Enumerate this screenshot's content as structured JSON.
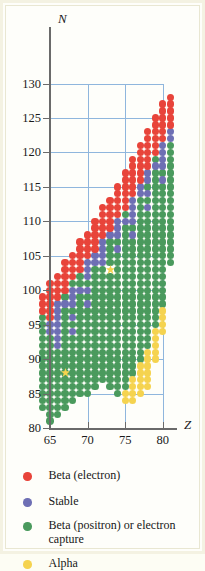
{
  "figure": {
    "kind": "nuclide-stability-chart",
    "axes": {
      "x": {
        "name": "Z",
        "ticks": [
          65,
          70,
          75,
          80
        ],
        "min": 63,
        "max": 82,
        "gridlines": [
          70,
          75,
          80
        ]
      },
      "y": {
        "name": "N",
        "ticks": [
          80,
          85,
          90,
          95,
          100,
          105,
          110,
          115,
          120,
          125,
          130
        ],
        "min": 80,
        "max": 131,
        "gridlines": [
          85,
          90,
          95,
          100,
          105,
          110,
          115,
          120,
          125,
          130
        ]
      },
      "grid": true
    }
  },
  "colors": {
    "beta_electron": "#e8443a",
    "stable": "#6e6fb4",
    "beta_positron": "#4a9a5d",
    "alpha": "#f5d34f",
    "grid": "#8fb6dd",
    "axis": "#6a6a6a",
    "background": "#fefefa",
    "border": "#f4f2e2"
  },
  "legend": {
    "position": "below-plot",
    "items": [
      {
        "label": "Beta (electron)",
        "color_key": "beta_electron"
      },
      {
        "label": "Stable",
        "color_key": "stable"
      },
      {
        "label": "Beta (positron) or electron capture",
        "color_key": "beta_positron"
      },
      {
        "label": "Alpha",
        "color_key": "alpha"
      }
    ]
  },
  "chart_data": {
    "type": "scatter",
    "title": "",
    "xlabel": "Z",
    "ylabel": "N",
    "xlim": [
      63,
      82
    ],
    "ylim": [
      80,
      131
    ],
    "grid": true,
    "marker": "filled-circle",
    "series": [
      {
        "name": "Beta (electron)",
        "color": "#e8443a"
      },
      {
        "name": "Stable",
        "color": "#6e6fb4"
      },
      {
        "name": "Beta (positron) or electron capture",
        "color": "#4a9a5d"
      },
      {
        "name": "Alpha",
        "color": "#f5d34f"
      }
    ],
    "columns": [
      {
        "Z": 64,
        "beta_electron": [
          97,
          98,
          99
        ],
        "stable": [],
        "beta_positron": [
          83,
          84,
          85,
          86,
          87,
          88,
          89,
          90,
          91,
          92,
          93,
          94,
          95,
          96
        ],
        "alpha": [],
        "star": []
      },
      {
        "Z": 65,
        "beta_electron": [
          96,
          97,
          98,
          99,
          100,
          101
        ],
        "stable": [
          94,
          95
        ],
        "beta_positron": [
          81,
          82,
          83,
          84,
          85,
          86,
          87,
          88,
          89,
          90,
          91,
          92,
          93
        ],
        "alpha": [],
        "star": []
      },
      {
        "Z": 66,
        "beta_electron": [
          99,
          100,
          101,
          102
        ],
        "stable": [
          92,
          93,
          94,
          95,
          96,
          97,
          98
        ],
        "beta_positron": [
          82,
          83,
          84,
          85,
          86,
          87,
          88,
          89,
          90,
          91
        ],
        "alpha": [],
        "star": []
      },
      {
        "Z": 67,
        "beta_electron": [
          100,
          101,
          102,
          103,
          104
        ],
        "stable": [
          98
        ],
        "beta_positron": [
          83,
          84,
          85,
          86,
          87,
          88,
          89,
          90,
          91,
          92,
          93,
          94,
          95,
          96,
          97,
          99
        ],
        "alpha": [],
        "star": [
          88
        ]
      },
      {
        "Z": 68,
        "beta_electron": [
          102,
          103,
          104,
          105
        ],
        "stable": [
          94,
          96,
          98,
          99,
          100
        ],
        "beta_positron": [
          84,
          85,
          86,
          87,
          88,
          89,
          90,
          91,
          92,
          93,
          95,
          97,
          101
        ],
        "alpha": [],
        "star": []
      },
      {
        "Z": 69,
        "beta_electron": [
          103,
          104,
          105,
          106,
          107
        ],
        "stable": [
          100
        ],
        "beta_positron": [
          85,
          86,
          87,
          88,
          89,
          90,
          91,
          92,
          93,
          94,
          95,
          96,
          97,
          98,
          99,
          101,
          102
        ],
        "alpha": [],
        "star": []
      },
      {
        "Z": 70,
        "beta_electron": [
          105,
          106,
          107,
          108
        ],
        "stable": [
          98,
          100,
          102,
          103,
          104
        ],
        "beta_positron": [
          85,
          86,
          87,
          88,
          89,
          90,
          91,
          92,
          93,
          94,
          95,
          96,
          97,
          99,
          101
        ],
        "alpha": [],
        "star": []
      },
      {
        "Z": 71,
        "beta_electron": [
          106,
          107,
          108,
          109,
          110
        ],
        "stable": [
          104,
          105
        ],
        "beta_positron": [
          86,
          87,
          88,
          89,
          90,
          91,
          92,
          93,
          94,
          95,
          96,
          97,
          98,
          99,
          100,
          101,
          102,
          103
        ],
        "alpha": [],
        "star": []
      },
      {
        "Z": 72,
        "beta_electron": [
          108,
          109,
          110,
          111,
          112
        ],
        "stable": [
          104,
          105,
          106,
          107
        ],
        "beta_positron": [
          87,
          88,
          89,
          90,
          91,
          92,
          93,
          94,
          95,
          96,
          97,
          98,
          99,
          100,
          101,
          102,
          103
        ],
        "alpha": [],
        "star": []
      },
      {
        "Z": 73,
        "beta_electron": [
          109,
          110,
          111,
          112,
          113
        ],
        "stable": [
          108
        ],
        "beta_positron": [
          86,
          87,
          88,
          89,
          90,
          91,
          92,
          93,
          94,
          95,
          96,
          97,
          98,
          99,
          100,
          101,
          102,
          104,
          105,
          106,
          107
        ],
        "alpha": [],
        "star": [
          103
        ]
      },
      {
        "Z": 74,
        "beta_electron": [
          111,
          112,
          113,
          114,
          115
        ],
        "stable": [
          106,
          108,
          109,
          110
        ],
        "beta_positron": [
          85,
          86,
          87,
          88,
          89,
          90,
          91,
          92,
          93,
          94,
          95,
          96,
          97,
          98,
          99,
          100,
          101,
          102,
          103,
          104,
          105,
          107
        ],
        "alpha": [],
        "star": []
      },
      {
        "Z": 75,
        "beta_electron": [
          112,
          113,
          114,
          115,
          116,
          117
        ],
        "stable": [
          110
        ],
        "beta_positron": [
          86,
          87,
          88,
          89,
          90,
          91,
          92,
          93,
          94,
          95,
          96,
          97,
          98,
          99,
          100,
          101,
          102,
          103,
          104,
          105,
          106,
          107,
          108,
          109,
          111
        ],
        "alpha": [
          84,
          85
        ],
        "star": []
      },
      {
        "Z": 76,
        "beta_electron": [
          114,
          115,
          116,
          117,
          118,
          119
        ],
        "stable": [
          108,
          110,
          111,
          112,
          113
        ],
        "beta_positron": [
          88,
          89,
          90,
          91,
          92,
          93,
          94,
          95,
          96,
          97,
          98,
          99,
          100,
          101,
          102,
          103,
          104,
          105,
          106,
          107,
          109
        ],
        "alpha": [
          84,
          85,
          86,
          87
        ],
        "star": []
      },
      {
        "Z": 77,
        "beta_electron": [
          116,
          117,
          118,
          119,
          120,
          121
        ],
        "stable": [
          114,
          115
        ],
        "beta_positron": [
          90,
          91,
          92,
          93,
          94,
          95,
          96,
          97,
          98,
          99,
          100,
          101,
          102,
          103,
          104,
          105,
          106,
          107,
          108,
          109,
          110,
          111,
          112,
          113
        ],
        "alpha": [
          85,
          86,
          87,
          88,
          89
        ],
        "star": []
      },
      {
        "Z": 78,
        "beta_electron": [
          118,
          119,
          120,
          121,
          122,
          123
        ],
        "stable": [
          112,
          114,
          116,
          117
        ],
        "beta_positron": [
          92,
          93,
          94,
          95,
          96,
          97,
          98,
          99,
          100,
          101,
          102,
          103,
          104,
          105,
          106,
          107,
          108,
          109,
          110,
          111,
          113,
          115
        ],
        "alpha": [
          86,
          87,
          88,
          89,
          90,
          91
        ],
        "star": []
      },
      {
        "Z": 79,
        "beta_electron": [
          120,
          121,
          122,
          123,
          124,
          125
        ],
        "stable": [
          118
        ],
        "beta_positron": [
          95,
          96,
          97,
          98,
          99,
          100,
          101,
          102,
          103,
          104,
          105,
          106,
          107,
          108,
          109,
          110,
          111,
          112,
          113,
          114,
          115,
          116,
          117,
          119
        ],
        "alpha": [
          90,
          91,
          92,
          93,
          94
        ],
        "star": []
      },
      {
        "Z": 80,
        "beta_electron": [
          122,
          123,
          124,
          125,
          126,
          127
        ],
        "stable": [
          116,
          118,
          119,
          120,
          121
        ],
        "beta_positron": [
          98,
          99,
          100,
          101,
          102,
          103,
          104,
          105,
          106,
          107,
          108,
          109,
          110,
          111,
          112,
          113,
          114,
          115,
          117
        ],
        "alpha": [
          94,
          95,
          96,
          97
        ],
        "star": []
      },
      {
        "Z": 81,
        "beta_electron": [
          124,
          125,
          126,
          127,
          128
        ],
        "stable": [
          122,
          123
        ],
        "beta_positron": [
          104,
          105,
          106,
          107,
          108,
          109,
          110,
          111,
          112,
          113,
          114,
          115,
          116,
          117,
          118,
          119,
          120,
          121
        ],
        "alpha": [],
        "star": []
      }
    ]
  }
}
